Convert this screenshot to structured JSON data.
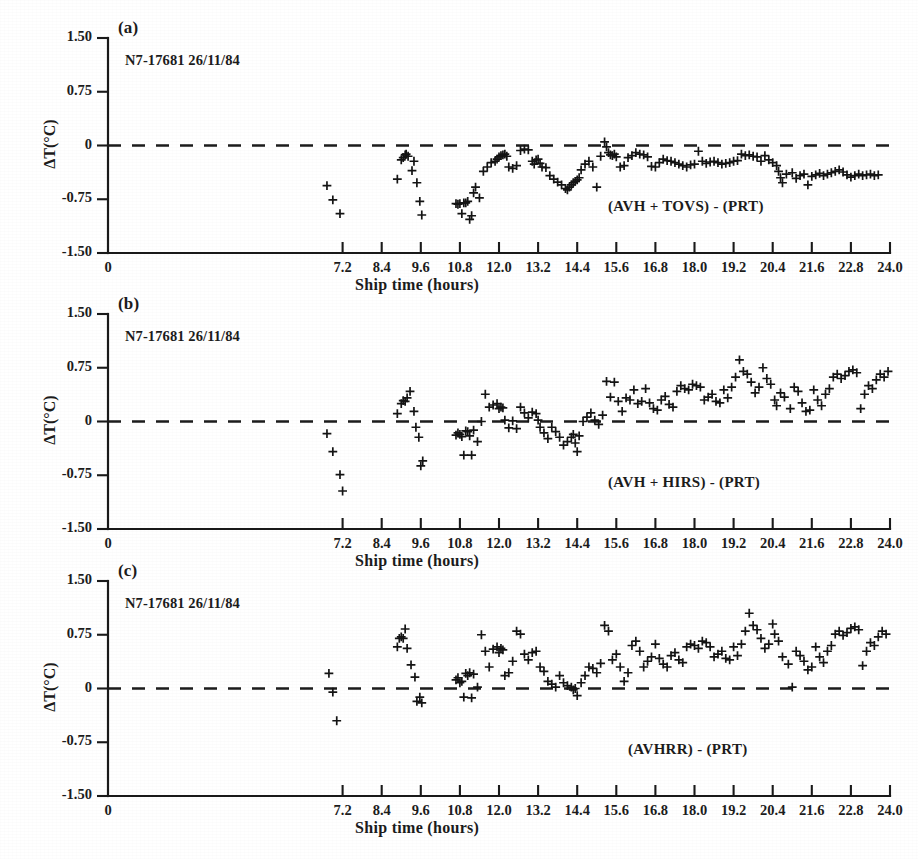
{
  "figure": {
    "xlabel": "Ship time (hours)",
    "ylabel": "ΔT(°C)",
    "series_id": "N7-17681  26/11/84",
    "xtick_labels": [
      "0",
      "7.2",
      "8.4",
      "9.6",
      "10.8",
      "12.0",
      "13.2",
      "14.4",
      "15.6",
      "16.8",
      "18.0",
      "19.2",
      "20.4",
      "21.6",
      "22.8",
      "24.0"
    ],
    "ytick_labels": [
      "1.50",
      "0.75",
      "0",
      "-0.75",
      "-1.50"
    ],
    "marker_color": "#141414",
    "axis_color": "#1a1a1a",
    "zero_line_color": "#1c1c1c"
  },
  "panels": [
    {
      "tag": "(a)",
      "series_id": "N7-17681  26/11/84",
      "curve_label": "(AVH + TOVS) - (PRT)"
    },
    {
      "tag": "(b)",
      "series_id": "N7-17681  26/11/84",
      "curve_label": "(AVH + HIRS) - (PRT)"
    },
    {
      "tag": "(c)",
      "series_id": "N7-17681  26/11/84",
      "curve_label": "(AVHRR) - (PRT)"
    }
  ],
  "chart_data": [
    {
      "type": "scatter",
      "panel": "(a)",
      "title": "(AVH + TOVS) - (PRT)",
      "xlabel": "Ship time (hours)",
      "ylabel": "ΔT(°C)",
      "xlim": [
        0,
        24.0
      ],
      "ylim": [
        -1.5,
        1.5
      ],
      "xticks": [
        0,
        7.2,
        8.4,
        9.6,
        10.8,
        12.0,
        13.2,
        14.4,
        15.6,
        16.8,
        18.0,
        19.2,
        20.4,
        21.6,
        22.8,
        24.0
      ],
      "yticks": [
        1.5,
        0.75,
        0,
        -0.75,
        -1.5
      ],
      "grid": false,
      "legend": "none",
      "reference_line": {
        "y": 0,
        "style": "dashed"
      },
      "x": [
        6.72,
        6.9,
        7.12,
        8.88,
        9.0,
        9.06,
        9.12,
        9.15,
        9.21,
        9.33,
        9.39,
        9.48,
        9.57,
        9.63,
        10.68,
        10.74,
        10.8,
        10.86,
        10.92,
        10.98,
        11.04,
        11.1,
        11.16,
        11.22,
        11.28,
        11.4,
        11.52,
        11.64,
        11.76,
        11.88,
        11.94,
        12.0,
        12.06,
        12.12,
        12.18,
        12.24,
        12.3,
        12.42,
        12.54,
        12.66,
        12.78,
        12.9,
        13.02,
        13.08,
        13.14,
        13.2,
        13.26,
        13.32,
        13.44,
        13.56,
        13.68,
        13.8,
        13.92,
        14.04,
        14.1,
        14.16,
        14.22,
        14.28,
        14.34,
        14.4,
        14.46,
        14.52,
        14.64,
        14.76,
        14.88,
        15.0,
        15.12,
        15.24,
        15.3,
        15.36,
        15.42,
        15.48,
        15.54,
        15.6,
        15.72,
        15.84,
        15.96,
        16.08,
        16.2,
        16.32,
        16.44,
        16.56,
        16.68,
        16.8,
        16.92,
        17.04,
        17.16,
        17.28,
        17.4,
        17.52,
        17.64,
        17.76,
        17.88,
        18.0,
        18.12,
        18.24,
        18.36,
        18.48,
        18.6,
        18.72,
        18.84,
        18.96,
        19.08,
        19.2,
        19.32,
        19.44,
        19.56,
        19.68,
        19.8,
        19.92,
        20.04,
        20.16,
        20.28,
        20.4,
        20.52,
        20.58,
        20.64,
        20.7,
        20.82,
        21.0,
        21.12,
        21.24,
        21.36,
        21.48,
        21.6,
        21.72,
        21.84,
        21.96,
        22.08,
        22.2,
        22.32,
        22.44,
        22.56,
        22.68,
        22.8,
        22.92,
        23.04,
        23.16,
        23.28,
        23.4,
        23.52,
        23.64,
        23.76,
        23.88
      ],
      "y": [
        -0.56,
        -0.76,
        -0.95,
        -0.47,
        -0.2,
        -0.17,
        -0.13,
        -0.12,
        -0.15,
        -0.35,
        -0.22,
        -0.52,
        -0.78,
        -0.97,
        -0.81,
        -0.82,
        -0.81,
        -0.95,
        -0.8,
        -0.8,
        -0.78,
        -1.03,
        -0.98,
        -0.66,
        -0.58,
        -0.73,
        -0.36,
        -0.3,
        -0.24,
        -0.22,
        -0.19,
        -0.16,
        -0.14,
        -0.13,
        -0.12,
        -0.15,
        -0.3,
        -0.32,
        -0.28,
        -0.07,
        -0.05,
        -0.06,
        -0.22,
        -0.26,
        -0.2,
        -0.19,
        -0.25,
        -0.3,
        -0.31,
        -0.42,
        -0.47,
        -0.51,
        -0.55,
        -0.6,
        -0.62,
        -0.58,
        -0.55,
        -0.52,
        -0.5,
        -0.48,
        -0.45,
        -0.34,
        -0.26,
        -0.22,
        -0.3,
        -0.58,
        -0.15,
        0.05,
        -0.02,
        -0.1,
        -0.13,
        -0.14,
        -0.12,
        -0.16,
        -0.3,
        -0.28,
        -0.17,
        -0.14,
        -0.1,
        -0.12,
        -0.13,
        -0.16,
        -0.29,
        -0.3,
        -0.24,
        -0.19,
        -0.21,
        -0.22,
        -0.24,
        -0.26,
        -0.28,
        -0.3,
        -0.27,
        -0.26,
        -0.08,
        -0.22,
        -0.25,
        -0.23,
        -0.22,
        -0.24,
        -0.26,
        -0.25,
        -0.24,
        -0.22,
        -0.21,
        -0.12,
        -0.14,
        -0.13,
        -0.15,
        -0.16,
        -0.22,
        -0.14,
        -0.2,
        -0.24,
        -0.28,
        -0.36,
        -0.45,
        -0.52,
        -0.4,
        -0.38,
        -0.46,
        -0.42,
        -0.4,
        -0.55,
        -0.43,
        -0.41,
        -0.39,
        -0.42,
        -0.4,
        -0.38,
        -0.36,
        -0.34,
        -0.37,
        -0.41,
        -0.44,
        -0.42,
        -0.4,
        -0.42,
        -0.41,
        -0.4,
        -0.42,
        -0.41
      ]
    },
    {
      "type": "scatter",
      "panel": "(b)",
      "title": "(AVH + HIRS) - (PRT)",
      "xlabel": "Ship time (hours)",
      "ylabel": "ΔT(°C)",
      "xlim": [
        0,
        24.0
      ],
      "ylim": [
        -1.5,
        1.5
      ],
      "xticks": [
        0,
        7.2,
        8.4,
        9.6,
        10.8,
        12.0,
        13.2,
        14.4,
        15.6,
        16.8,
        18.0,
        19.2,
        20.4,
        21.6,
        22.8,
        24.0
      ],
      "yticks": [
        1.5,
        0.75,
        0,
        -0.75,
        -1.5
      ],
      "grid": false,
      "legend": "none",
      "reference_line": {
        "y": 0,
        "style": "dashed"
      },
      "x": [
        6.72,
        6.9,
        7.12,
        7.2,
        8.88,
        9.0,
        9.06,
        9.12,
        9.18,
        9.27,
        9.39,
        9.45,
        9.54,
        9.6,
        9.66,
        10.68,
        10.74,
        10.8,
        10.86,
        10.92,
        10.98,
        11.04,
        11.1,
        11.16,
        11.22,
        11.34,
        11.46,
        11.58,
        11.7,
        11.82,
        11.94,
        12.0,
        12.06,
        12.12,
        12.18,
        12.3,
        12.42,
        12.54,
        12.66,
        12.78,
        12.9,
        13.02,
        13.14,
        13.2,
        13.26,
        13.38,
        13.5,
        13.62,
        13.74,
        13.86,
        13.98,
        14.1,
        14.22,
        14.28,
        14.34,
        14.4,
        14.46,
        14.58,
        14.7,
        14.82,
        14.94,
        15.06,
        15.18,
        15.3,
        15.42,
        15.54,
        15.66,
        15.78,
        15.9,
        16.02,
        16.14,
        16.26,
        16.38,
        16.5,
        16.62,
        16.74,
        16.86,
        16.98,
        17.1,
        17.22,
        17.34,
        17.46,
        17.58,
        17.7,
        17.82,
        17.94,
        18.06,
        18.18,
        18.3,
        18.42,
        18.54,
        18.66,
        18.78,
        18.9,
        19.02,
        19.14,
        19.26,
        19.38,
        19.5,
        19.62,
        19.74,
        19.86,
        19.98,
        20.1,
        20.22,
        20.34,
        20.46,
        20.52,
        20.64,
        20.76,
        20.94,
        21.06,
        21.18,
        21.3,
        21.42,
        21.54,
        21.66,
        21.78,
        21.9,
        22.02,
        22.14,
        22.26,
        22.38,
        22.5,
        22.62,
        22.74,
        22.86,
        22.98,
        23.1,
        23.22,
        23.34,
        23.46,
        23.58,
        23.7,
        23.82,
        23.94
      ],
      "y": [
        -0.17,
        -0.42,
        -0.74,
        -0.97,
        0.11,
        0.25,
        0.29,
        0.28,
        0.33,
        0.42,
        0.14,
        -0.08,
        -0.22,
        -0.62,
        -0.55,
        -0.19,
        -0.16,
        -0.18,
        -0.21,
        -0.47,
        -0.13,
        -0.14,
        -0.2,
        -0.47,
        -0.12,
        -0.28,
        0.0,
        0.38,
        0.2,
        0.23,
        0.25,
        0.18,
        0.2,
        0.19,
        0.02,
        -0.09,
        0.01,
        -0.1,
        0.2,
        0.12,
        0.05,
        0.13,
        0.11,
        0.02,
        -0.08,
        -0.16,
        -0.24,
        -0.08,
        -0.14,
        -0.22,
        -0.33,
        -0.28,
        -0.22,
        -0.18,
        -0.3,
        -0.42,
        -0.2,
        0.0,
        0.06,
        0.12,
        0.02,
        -0.04,
        0.09,
        0.56,
        0.34,
        0.55,
        0.28,
        0.14,
        0.33,
        0.3,
        0.44,
        0.25,
        0.28,
        0.46,
        0.26,
        0.18,
        0.16,
        0.3,
        0.35,
        0.24,
        0.2,
        0.42,
        0.5,
        0.46,
        0.44,
        0.52,
        0.5,
        0.48,
        0.3,
        0.34,
        0.38,
        0.28,
        0.26,
        0.44,
        0.33,
        0.48,
        0.62,
        0.86,
        0.7,
        0.66,
        0.55,
        0.4,
        0.48,
        0.75,
        0.6,
        0.52,
        0.3,
        0.22,
        0.4,
        0.34,
        0.18,
        0.48,
        0.42,
        0.26,
        0.14,
        0.16,
        0.44,
        0.3,
        0.22,
        0.38,
        0.46,
        0.62,
        0.66,
        0.6,
        0.64,
        0.7,
        0.72,
        0.68,
        0.18,
        0.38,
        0.5,
        0.46,
        0.58,
        0.66,
        0.62,
        0.7
      ]
    },
    {
      "type": "scatter",
      "panel": "(c)",
      "title": "(AVHRR) - (PRT)",
      "xlabel": "Ship time (hours)",
      "ylabel": "ΔT(°C)",
      "xlim": [
        0,
        24.0
      ],
      "ylim": [
        -1.5,
        1.5
      ],
      "xticks": [
        0,
        7.2,
        8.4,
        9.6,
        10.8,
        12.0,
        13.2,
        14.4,
        15.6,
        16.8,
        18.0,
        19.2,
        20.4,
        21.6,
        22.8,
        24.0
      ],
      "yticks": [
        1.5,
        0.75,
        0,
        -0.75,
        -1.5
      ],
      "grid": false,
      "legend": "none",
      "reference_line": {
        "y": 0,
        "style": "dashed"
      },
      "x": [
        6.78,
        6.9,
        7.02,
        8.88,
        8.94,
        9.0,
        9.06,
        9.12,
        9.18,
        9.3,
        9.42,
        9.48,
        9.57,
        9.63,
        10.68,
        10.74,
        10.8,
        10.86,
        10.92,
        10.98,
        11.04,
        11.1,
        11.16,
        11.22,
        11.34,
        11.46,
        11.58,
        11.7,
        11.82,
        11.94,
        12.0,
        12.06,
        12.12,
        12.18,
        12.3,
        12.42,
        12.54,
        12.66,
        12.78,
        12.9,
        13.02,
        13.14,
        13.26,
        13.38,
        13.5,
        13.62,
        13.74,
        13.86,
        13.98,
        14.1,
        14.22,
        14.28,
        14.34,
        14.4,
        14.52,
        14.64,
        14.76,
        14.88,
        15.0,
        15.12,
        15.24,
        15.36,
        15.48,
        15.6,
        15.72,
        15.84,
        15.96,
        16.08,
        16.2,
        16.32,
        16.44,
        16.56,
        16.68,
        16.8,
        16.92,
        17.04,
        17.16,
        17.28,
        17.4,
        17.52,
        17.64,
        17.76,
        17.88,
        18.0,
        18.12,
        18.24,
        18.36,
        18.48,
        18.6,
        18.72,
        18.84,
        18.96,
        19.08,
        19.2,
        19.32,
        19.44,
        19.56,
        19.68,
        19.8,
        19.92,
        20.04,
        20.16,
        20.28,
        20.4,
        20.46,
        20.58,
        20.7,
        20.88,
        21.0,
        21.12,
        21.24,
        21.36,
        21.48,
        21.6,
        21.72,
        21.84,
        21.96,
        22.08,
        22.2,
        22.32,
        22.44,
        22.56,
        22.68,
        22.8,
        22.92,
        23.04,
        23.16,
        23.28,
        23.4,
        23.52,
        23.64,
        23.76,
        23.88
      ],
      "y": [
        0.21,
        -0.05,
        -0.45,
        0.58,
        0.7,
        0.72,
        0.7,
        0.83,
        0.56,
        0.33,
        0.16,
        -0.18,
        -0.12,
        -0.2,
        0.12,
        0.15,
        0.08,
        0.1,
        -0.12,
        0.21,
        0.18,
        0.22,
        -0.13,
        0.2,
        0.02,
        0.75,
        0.52,
        0.3,
        0.55,
        0.58,
        0.5,
        0.56,
        0.54,
        0.18,
        0.22,
        0.38,
        0.8,
        0.76,
        0.48,
        0.4,
        0.5,
        0.52,
        0.3,
        0.24,
        0.1,
        0.06,
        0.02,
        0.18,
        0.08,
        0.04,
        0.02,
        -0.02,
        0.0,
        -0.1,
        0.08,
        0.18,
        0.3,
        0.28,
        0.22,
        0.35,
        0.88,
        0.8,
        0.4,
        0.48,
        0.3,
        0.1,
        0.22,
        0.6,
        0.66,
        0.52,
        0.3,
        0.38,
        0.44,
        0.62,
        0.42,
        0.34,
        0.3,
        0.46,
        0.5,
        0.4,
        0.36,
        0.58,
        0.62,
        0.6,
        0.56,
        0.66,
        0.64,
        0.58,
        0.44,
        0.48,
        0.52,
        0.42,
        0.4,
        0.58,
        0.46,
        0.62,
        0.8,
        1.05,
        0.88,
        0.82,
        0.7,
        0.56,
        0.62,
        0.9,
        0.76,
        0.66,
        0.44,
        0.34,
        0.02,
        0.52,
        0.46,
        0.38,
        0.26,
        0.3,
        0.58,
        0.44,
        0.36,
        0.52,
        0.6,
        0.76,
        0.8,
        0.74,
        0.78,
        0.84,
        0.86,
        0.82,
        0.32,
        0.52,
        0.64,
        0.6,
        0.72,
        0.8,
        0.76,
        0.84
      ]
    }
  ]
}
